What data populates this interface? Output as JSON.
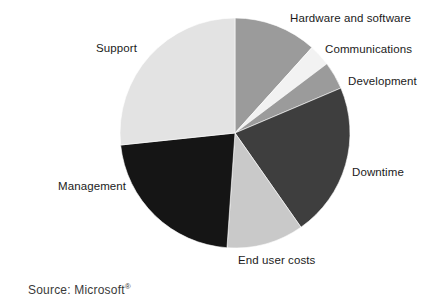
{
  "figure": {
    "source_prefix": "Source: Microsoft",
    "source_mark": "®"
  },
  "chart_data": {
    "type": "pie",
    "title": "",
    "subtitle": "",
    "xlabel": "",
    "ylabel": "",
    "legend_position": "none",
    "labels_position": "outside-callout",
    "grid": false,
    "start_angle_deg": 0,
    "direction": "clockwise",
    "center": {
      "x": 235,
      "y": 133
    },
    "radius": 115,
    "categories": [
      "Hardware and software",
      "Communications",
      "Development",
      "Downtime",
      "End user costs",
      "Management",
      "Support"
    ],
    "values": [
      11.7,
      3.1,
      3.9,
      21.7,
      10.8,
      22.2,
      26.6
    ],
    "slices": [
      {
        "label": "Hardware and software",
        "value": 11.7,
        "start_deg": 0,
        "end_deg": 42,
        "color": "#9b9b9b",
        "label_x": 290,
        "label_y": 12
      },
      {
        "label": "Communications",
        "value": 3.1,
        "start_deg": 42,
        "end_deg": 53,
        "color": "#f2f2f2",
        "label_x": 325,
        "label_y": 43
      },
      {
        "label": "Development",
        "value": 3.9,
        "start_deg": 53,
        "end_deg": 67,
        "color": "#9b9b9b",
        "label_x": 348,
        "label_y": 75
      },
      {
        "label": "Downtime",
        "value": 21.7,
        "start_deg": 67,
        "end_deg": 145,
        "color": "#3e3e3e",
        "label_x": 352,
        "label_y": 166
      },
      {
        "label": "End user costs",
        "value": 10.8,
        "start_deg": 145,
        "end_deg": 184,
        "color": "#c9c9c9",
        "label_x": 238,
        "label_y": 254
      },
      {
        "label": "Management",
        "value": 22.2,
        "start_deg": 184,
        "end_deg": 264,
        "color": "#151515",
        "label_x": 58,
        "label_y": 180
      },
      {
        "label": "Support",
        "value": 26.6,
        "start_deg": 264,
        "end_deg": 360,
        "color": "#e3e3e3",
        "label_x": 96,
        "label_y": 42
      }
    ]
  },
  "colors": {
    "background": "#ffffff",
    "text": "#1b1b1b",
    "source_text": "#3a3a3a",
    "slice_outline": "#ffffff"
  }
}
